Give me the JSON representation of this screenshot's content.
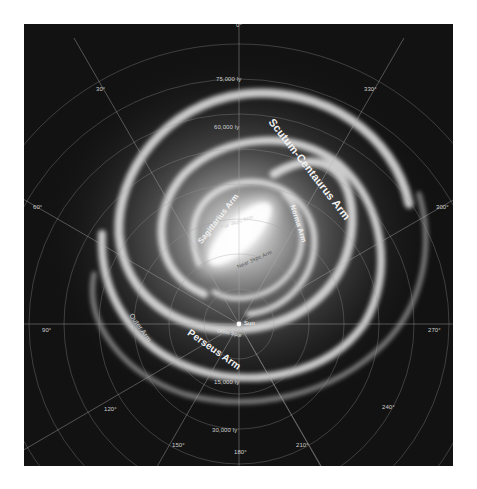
{
  "map": {
    "title": "Galactic Longitude",
    "background_color": "#121212",
    "glow_color": "#f4f4f4",
    "grid_color": "#8a8a8a",
    "center": {
      "x": 216,
      "y": 230
    },
    "longitude_labels": [
      "0°",
      "30°",
      "60°",
      "90°",
      "120°",
      "150°",
      "180°",
      "210°",
      "240°",
      "270°",
      "300°",
      "330°"
    ],
    "distance_labels": {
      "north": [
        "75,000 ly",
        "60,000 ly"
      ],
      "south": [
        "15,000 ly",
        "30,000 ly"
      ]
    },
    "arms": {
      "scutum_centaurus": "Scutum-Centaurus Arm",
      "sagittarius": "Sagittarius Arm",
      "norma": "Norma Arm",
      "far_3kpc": "Far 3kpc Arm",
      "near_3kpc": "Near 3kpc Arm",
      "perseus": "Perseus Arm",
      "outer": "Outer Arm",
      "orion_spur": "Orion Spur"
    },
    "markers": {
      "sun": "Sun"
    }
  }
}
